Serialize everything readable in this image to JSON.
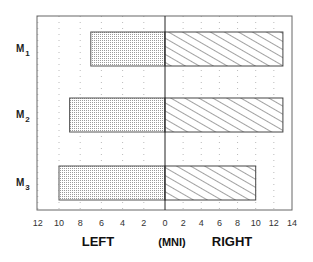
{
  "chart_data": {
    "type": "bar",
    "orientation": "horizontal-diverging",
    "title": "",
    "categories": [
      "M1",
      "M2",
      "M3"
    ],
    "series": [
      {
        "name": "LEFT",
        "values": [
          7,
          9,
          10
        ],
        "pattern": "dotted"
      },
      {
        "name": "RIGHT",
        "values": [
          13,
          13,
          10
        ],
        "pattern": "diagonal-hatch"
      }
    ],
    "xlabel_left": "LEFT",
    "xlabel_center": "(MNI)",
    "xlabel_right": "RIGHT",
    "left_ticks": [
      "12",
      "10",
      "8",
      "6",
      "4",
      "2",
      "0"
    ],
    "right_ticks": [
      "0",
      "2",
      "4",
      "6",
      "8",
      "10",
      "12",
      "14"
    ],
    "xlim_left": [
      12,
      0
    ],
    "xlim_right": [
      0,
      14
    ],
    "grid": "dotted vertical",
    "legend": "none"
  },
  "labels": {
    "cat_main": [
      "M",
      "M",
      "M"
    ],
    "cat_sub": [
      "1",
      "2",
      "3"
    ]
  }
}
